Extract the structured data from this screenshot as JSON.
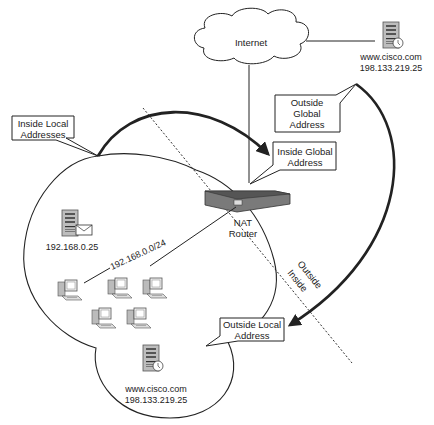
{
  "diagram": {
    "internet": {
      "label": "Internet"
    },
    "external_server": {
      "hostname": "www.cisco.com",
      "ip": "198.133.219.25"
    },
    "inside_server": {
      "ip": "192.168.0.25"
    },
    "inside_network": {
      "subnet": "192.168.0.0/24"
    },
    "outside_local_server": {
      "hostname": "www.cisco.com",
      "ip": "198.133.219.25"
    },
    "router": {
      "line1": "NAT",
      "line2": "Router"
    },
    "boundary": {
      "outside": "Outside",
      "inside": "Inside"
    },
    "callouts": {
      "inside_local": {
        "line1": "Inside Local",
        "line2": "Addresses"
      },
      "inside_global": {
        "line1": "Inside Global",
        "line2": "Address"
      },
      "outside_global": {
        "line1": "Outside",
        "line2": "Global",
        "line3": "Address"
      },
      "outside_local": {
        "line1": "Outside Local",
        "line2": "Address"
      }
    },
    "colors": {
      "line": "#222222",
      "router": "#707070",
      "server": "#9a9a9a"
    }
  }
}
